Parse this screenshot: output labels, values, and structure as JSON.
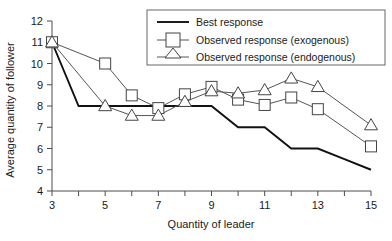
{
  "chart_data": {
    "type": "line",
    "title": "",
    "xlabel": "Quantity of leader",
    "ylabel": "Average quantity of follower",
    "xlim": [
      3,
      15
    ],
    "ylim": [
      4,
      12
    ],
    "grid": false,
    "legend_position": "top-right",
    "x": [
      3,
      5,
      6,
      7,
      8,
      9,
      10,
      11,
      12,
      13,
      15
    ],
    "xticks": [
      3,
      4,
      5,
      6,
      7,
      8,
      9,
      10,
      11,
      12,
      13,
      14,
      15
    ],
    "xtick_labels": [
      "3",
      "",
      "5",
      "",
      "7",
      "",
      "9",
      "",
      "11",
      "",
      "13",
      "",
      "15"
    ],
    "yticks": [
      4,
      5,
      6,
      7,
      8,
      9,
      10,
      11,
      12
    ],
    "ytick_labels": [
      "4",
      "5",
      "6",
      "7",
      "8",
      "9",
      "10",
      "11",
      "12"
    ],
    "series": [
      {
        "name": "Best response",
        "marker": "none",
        "x": [
          3,
          4,
          5,
          6,
          7,
          8,
          9,
          10,
          11,
          12,
          13,
          14,
          15
        ],
        "values": [
          11,
          8,
          8,
          8,
          8,
          8,
          8,
          7,
          7,
          6,
          6,
          5.5,
          5
        ]
      },
      {
        "name": "Observed response (exogenous)",
        "marker": "square",
        "x": [
          3,
          5,
          6,
          7,
          8,
          9,
          10,
          11,
          12,
          13,
          15
        ],
        "values": [
          11,
          10.0,
          8.5,
          7.9,
          8.55,
          8.9,
          8.3,
          8.05,
          8.4,
          7.85,
          6.1
        ]
      },
      {
        "name": "Observed response (endogenous)",
        "marker": "triangle",
        "x": [
          3,
          5,
          6,
          7,
          8,
          9,
          10,
          11,
          12,
          13,
          15
        ],
        "values": [
          11,
          8.0,
          7.55,
          7.55,
          8.2,
          8.7,
          8.6,
          8.75,
          9.3,
          8.9,
          7.1
        ]
      }
    ]
  },
  "legend": {
    "items": [
      {
        "label": "Best response",
        "marker": "none"
      },
      {
        "label": "Observed response (exogenous)",
        "marker": "square"
      },
      {
        "label": "Observed response (endogenous)",
        "marker": "triangle"
      }
    ]
  },
  "colors": {
    "best_response": "#111111",
    "observed_exogenous": "#555555",
    "observed_endogenous": "#555555",
    "axis": "#4d4d4d",
    "text": "#1a1a1a",
    "background": "#ffffff"
  }
}
